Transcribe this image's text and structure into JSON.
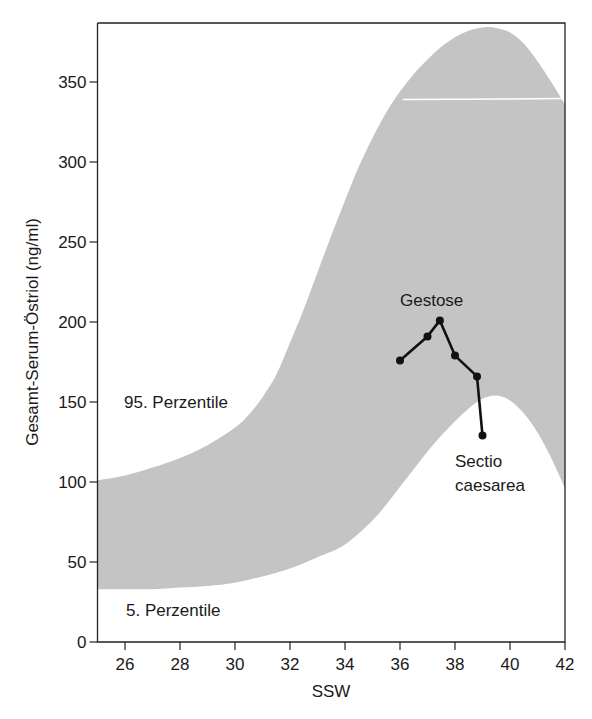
{
  "chart_data": {
    "type": "area",
    "title": "",
    "xlabel": "SSW",
    "ylabel": "Gesamt-Serum-Östriol (ng/ml)",
    "xlim": [
      25,
      42
    ],
    "ylim": [
      0,
      385
    ],
    "x_ticks": [
      26,
      28,
      30,
      32,
      34,
      36,
      38,
      40,
      42
    ],
    "y_ticks": [
      0,
      50,
      100,
      150,
      200,
      250,
      300,
      350
    ],
    "grid": false,
    "band_color": "#c4c4c4",
    "line_color": "#111111",
    "series": [
      {
        "name": "95. Perzentile",
        "role": "band-upper",
        "x": [
          25,
          26,
          27,
          28,
          29,
          30,
          30.5,
          31,
          31.5,
          32,
          32.5,
          33,
          33.5,
          34,
          34.5,
          35,
          35.5,
          36,
          36.5,
          37,
          37.5,
          38,
          38.5,
          39,
          39.4,
          40,
          40.5,
          41,
          41.5,
          42
        ],
        "values": [
          101,
          104,
          109,
          115,
          123,
          134,
          142,
          153,
          167,
          187,
          208,
          231,
          254,
          276,
          297,
          315,
          331,
          344,
          355,
          364,
          372,
          378,
          382,
          384,
          384,
          381,
          374,
          363,
          350,
          336
        ]
      },
      {
        "name": "5. Perzentile",
        "role": "band-lower",
        "x": [
          25,
          26,
          27,
          28,
          29,
          30,
          31,
          32,
          33,
          34,
          35,
          35.5,
          36,
          36.5,
          37,
          37.5,
          38,
          38.5,
          39,
          39.5,
          40,
          40.5,
          41,
          41.5,
          42
        ],
        "values": [
          33,
          33,
          33,
          34,
          35,
          37,
          41,
          46,
          53,
          61,
          76,
          86,
          97,
          108,
          119,
          129,
          138,
          146,
          152,
          154,
          151,
          143,
          131,
          115,
          96
        ]
      },
      {
        "name": "Gestose",
        "role": "patient-line",
        "x": [
          36.0,
          37.0,
          37.45,
          38.0,
          38.8,
          39.0
        ],
        "values": [
          176,
          191,
          201,
          179,
          166,
          129
        ]
      }
    ],
    "annotations": [
      {
        "text": "95. Perzentile",
        "x": 26.0,
        "y": 150
      },
      {
        "text": "5. Perzentile",
        "x": 26.1,
        "y": 20
      },
      {
        "text": "Gestose",
        "x": 36.0,
        "y": 212
      },
      {
        "text": "Sectio",
        "x": 38.5,
        "y": 115
      },
      {
        "text": "caesarea",
        "x": 38.5,
        "y": 92
      }
    ],
    "reference_line": {
      "y": 339,
      "x_from": 36.1,
      "x_to": 42,
      "color": "#ffffff"
    }
  },
  "labels": {
    "ylabel": "Gesamt-Serum-Östriol (ng/ml)",
    "xlabel": "SSW",
    "p95": "95. Perzentile",
    "p5": "5. Perzentile",
    "gestose": "Gestose",
    "sectio_1": "Sectio",
    "sectio_2": "caesarea"
  }
}
